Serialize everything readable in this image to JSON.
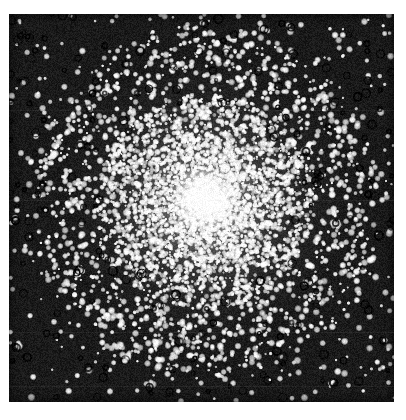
{
  "document": {
    "kind": "scanned-photograph",
    "subject": "globular-star-cluster",
    "page_background": "#ffffff",
    "alt_text": "Black and white halftone photograph of a globular star cluster: thousands of white stars concentrated into a dense bright core with density falling off toward a sparse dark outer field."
  },
  "plate": {
    "left": 9,
    "top": 14,
    "width": 385,
    "height": 388,
    "background_color": "#141414",
    "sky_color": "#1a1a1a",
    "star_color": "#ffffff",
    "core_color": "#fafafa",
    "artifact_ring_color": "#050505"
  },
  "cluster": {
    "center_x": 196,
    "center_y": 188,
    "core_radius": 34,
    "halo_radius": 108,
    "outer_radius": 170,
    "core_star_count": 2600,
    "halo_star_count": 1500,
    "field_star_count": 560,
    "artifact_ring_count": 230
  },
  "texture": {
    "grain_amount": 26,
    "scan_band_rows": [
      96,
      186,
      318,
      372
    ],
    "scan_band_opacity": 0.055
  },
  "caption": {
    "text": "",
    "visible": false
  },
  "chart_data": {
    "type": "scatter",
    "title": "",
    "xlabel": "",
    "ylabel": "",
    "radii_px": [
      0,
      20,
      40,
      60,
      80,
      100,
      120,
      140,
      160,
      180
    ],
    "relative_density": [
      1.0,
      0.93,
      0.72,
      0.48,
      0.3,
      0.18,
      0.1,
      0.055,
      0.03,
      0.015
    ]
  }
}
